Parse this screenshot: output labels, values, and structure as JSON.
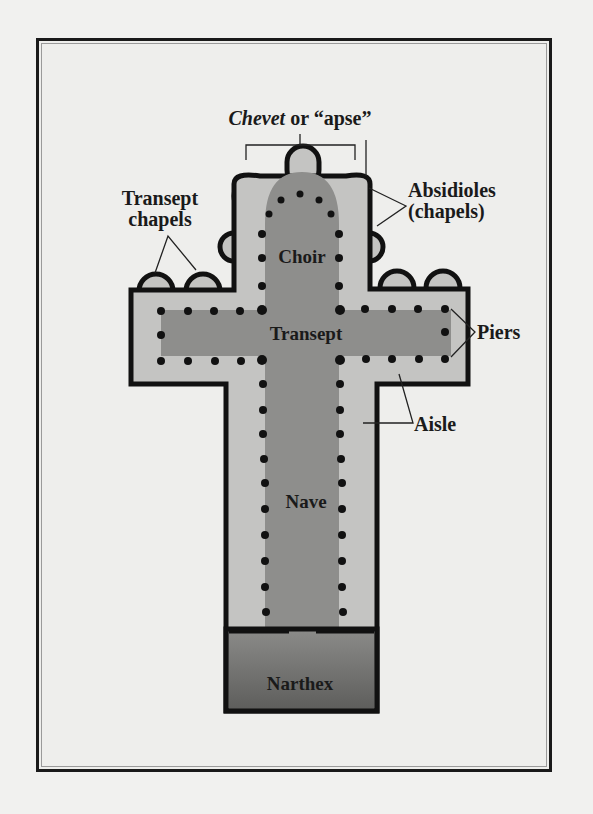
{
  "diagram": {
    "title_parts": {
      "italic": "Chevet",
      "rest": " or “apse”"
    },
    "labels": {
      "transept_chapels_line1": "Transept",
      "transept_chapels_line2": "chapels",
      "absidioles_line1": "Absidioles",
      "absidioles_line2": "(chapels)",
      "choir": "Choir",
      "transept": "Transept",
      "piers": "Piers",
      "aisle": "Aisle",
      "nave": "Nave",
      "narthex": "Narthex"
    },
    "colors": {
      "outline": "#111111",
      "aisle_fill": "#c4c4c2",
      "central_fill": "#8e8e8c",
      "narthex_fill": "#6f6f6d",
      "background": "#eeeeec"
    }
  }
}
